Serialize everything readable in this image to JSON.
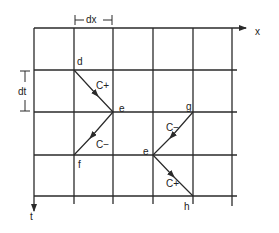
{
  "diagram": {
    "axes": {
      "x_label": "x",
      "t_label": "t"
    },
    "dimensions": {
      "dx_label": "dx",
      "dt_label": "dt"
    },
    "grid": {
      "columns_x": [
        34,
        74,
        113,
        153,
        193,
        232
      ],
      "rows_y": [
        28,
        70,
        112,
        155,
        196
      ]
    },
    "nodes": [
      {
        "id": "d",
        "label": "d",
        "x": 74,
        "y": 70
      },
      {
        "id": "e1",
        "label": "e",
        "x": 113,
        "y": 112
      },
      {
        "id": "f",
        "label": "f",
        "x": 74,
        "y": 155
      },
      {
        "id": "g",
        "label": "g",
        "x": 193,
        "y": 112
      },
      {
        "id": "e2",
        "label": "e",
        "x": 153,
        "y": 155
      },
      {
        "id": "h",
        "label": "h",
        "x": 193,
        "y": 196
      }
    ],
    "characteristics": [
      {
        "label": "C+",
        "from": "d",
        "to": "e1"
      },
      {
        "label": "C−",
        "from": "e1",
        "to": "f"
      },
      {
        "label": "C−",
        "from": "g",
        "to": "e2"
      },
      {
        "label": "C+",
        "from": "e2",
        "to": "h"
      }
    ],
    "line_color": "#2a2a2a"
  }
}
